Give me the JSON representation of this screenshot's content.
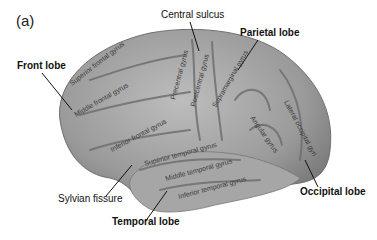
{
  "panel_label": "(a)",
  "lobes": {
    "frontal": "Front lobe",
    "parietal": "Parietal lobe",
    "temporal": "Temporal lobe",
    "occipital": "Occipital lobe"
  },
  "landmarks": {
    "central_sulcus": "Central sulcus",
    "sylvian_fissure": "Sylvian fissure"
  },
  "gyri": {
    "superior_frontal": "Superior frontal gyrus",
    "middle_frontal": "Middle frontal gyrus",
    "inferior_frontal": "Inferior frontal gyrus",
    "precentral": "Precentral gyrus",
    "postcentral": "Postcentral gyrus",
    "supramarginal": "Supramarginal gyrus",
    "angular": "Angular gyrus",
    "lateral_occipital": "Lateral occipital gyri",
    "superior_temporal": "Superior temporal gyrus",
    "middle_temporal": "Middle temporal gyrus",
    "inferior_temporal": "Inferior temporal gyrus"
  }
}
